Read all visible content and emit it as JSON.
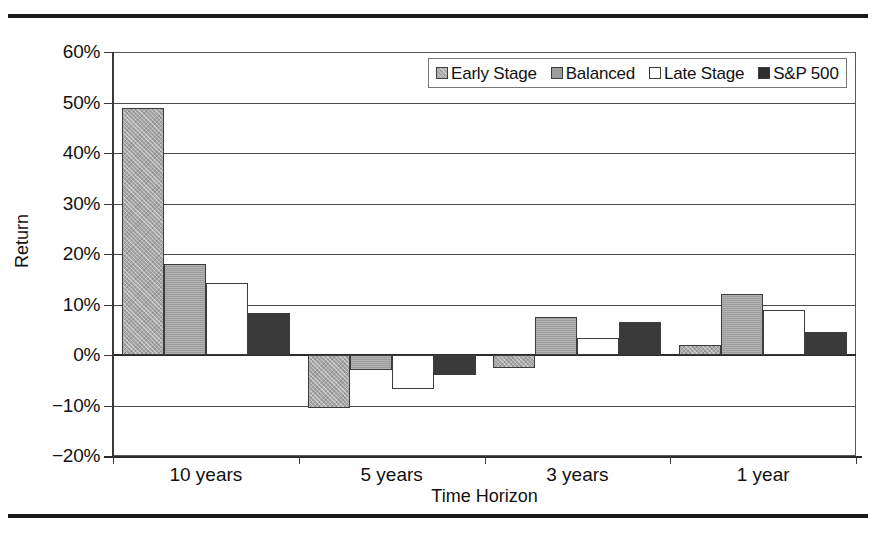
{
  "chart_data": {
    "type": "bar",
    "title": "",
    "subtitle": "",
    "xlabel": "Time Horizon",
    "ylabel": "Return",
    "categories": [
      "10 years",
      "5 years",
      "3 years",
      "1 year"
    ],
    "ylim": [
      -20,
      60
    ],
    "ytick_values": [
      60,
      50,
      40,
      30,
      20,
      10,
      0,
      -10,
      -20
    ],
    "ytick_labels": [
      "60%",
      "50%",
      "40%",
      "30%",
      "20%",
      "10%",
      "0%",
      "−10%",
      "−20%"
    ],
    "yunit": "%",
    "grid": true,
    "legend_position": "top-right",
    "orientation": "vertical",
    "series": [
      {
        "name": "Early Stage",
        "style": "s-early",
        "swatch": "light-gray-hatched",
        "values": [
          49.0,
          -10.5,
          -2.5,
          2.0
        ]
      },
      {
        "name": "Balanced",
        "style": "s-balanced",
        "swatch": "medium-gray",
        "values": [
          18.0,
          -3.0,
          7.6,
          12.0
        ]
      },
      {
        "name": "Late Stage",
        "style": "s-late",
        "swatch": "white",
        "values": [
          14.3,
          -6.7,
          3.4,
          9.0
        ]
      },
      {
        "name": "S&P 500",
        "style": "s-sp",
        "swatch": "dark-gray",
        "values": [
          8.3,
          -4.0,
          6.5,
          4.5
        ]
      }
    ]
  },
  "figure": {
    "has_top_rule": true,
    "has_bottom_rule": true
  }
}
